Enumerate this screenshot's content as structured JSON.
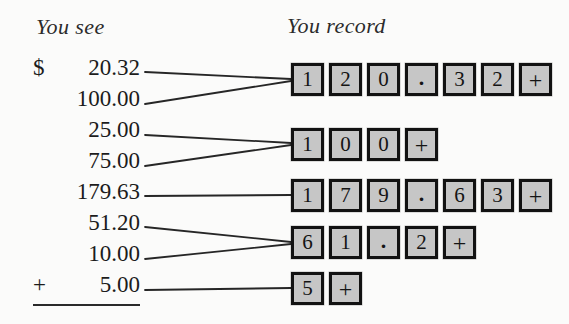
{
  "headings": {
    "left": "You see",
    "right": "You record"
  },
  "amounts": [
    {
      "prefix": "$",
      "value": "20.32"
    },
    {
      "prefix": "",
      "value": "100.00"
    },
    {
      "prefix": "",
      "value": "25.00"
    },
    {
      "prefix": "",
      "value": "75.00"
    },
    {
      "prefix": "",
      "value": "179.63"
    },
    {
      "prefix": "",
      "value": "51.20"
    },
    {
      "prefix": "",
      "value": "10.00"
    },
    {
      "prefix": "+",
      "value": "5.00"
    }
  ],
  "key_rows": [
    {
      "keys": [
        "1",
        "2",
        "0",
        ".",
        "3",
        "2",
        "+"
      ]
    },
    {
      "keys": [
        "1",
        "0",
        "0",
        "+"
      ]
    },
    {
      "keys": [
        "1",
        "7",
        "9",
        ".",
        "6",
        "3",
        "+"
      ]
    },
    {
      "keys": [
        "6",
        "1",
        ".",
        "2",
        "+"
      ]
    },
    {
      "keys": [
        "5",
        "+"
      ]
    }
  ],
  "colors": {
    "page_background": "#fbfbfa",
    "key_fill": "#c6c6c6",
    "key_border": "#121212",
    "ink": "#1c1c1c"
  }
}
